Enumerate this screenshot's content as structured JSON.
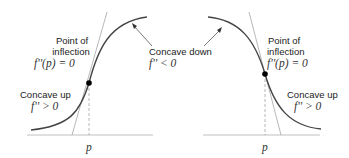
{
  "panels": [
    {
      "id": "left",
      "curve": "increasing",
      "inflection_label": [
        "Point of",
        "inflection"
      ],
      "inflection_eq": "f''(p) = 0",
      "up_label": "Concave up",
      "up_eq": "f'' > 0",
      "down_label": "Concave down",
      "down_eq": "f'' < 0",
      "axis_label": "p"
    },
    {
      "id": "right",
      "curve": "decreasing",
      "inflection_label": [
        "Point of",
        "inflection"
      ],
      "inflection_eq": "f''(p) = 0",
      "up_label": "Concave up",
      "up_eq": "f'' > 0",
      "axis_label": "p"
    }
  ],
  "colors": {
    "curve": "#444444",
    "tangent": "#888888",
    "axis": "#aaaaaa",
    "point": "#000000"
  }
}
